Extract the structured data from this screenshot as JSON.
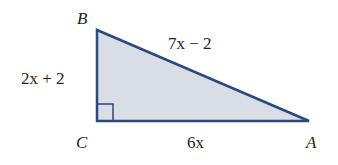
{
  "diagram": {
    "type": "right-triangle",
    "colors": {
      "stroke": "#2b4a7e",
      "fill": "#d9dde6",
      "text": "#222222"
    },
    "vertices": {
      "B": {
        "label": "B",
        "x": 97,
        "y": 30
      },
      "C": {
        "label": "C",
        "x": 97,
        "y": 121
      },
      "A": {
        "label": "A",
        "x": 309,
        "y": 121
      }
    },
    "right_angle_at": "C",
    "sides": {
      "BC": {
        "label": "2x + 2"
      },
      "AB": {
        "label": "7x − 2"
      },
      "CA": {
        "label": "6x"
      }
    }
  }
}
